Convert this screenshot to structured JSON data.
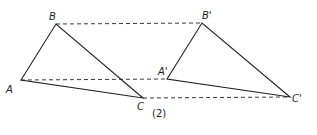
{
  "figure": {
    "caption": "(2)",
    "triangles": [
      {
        "name": "original",
        "vertices": [
          {
            "label": "A",
            "x": 21,
            "y": 80,
            "lx": 6,
            "ly": 93
          },
          {
            "label": "B",
            "x": 56,
            "y": 24,
            "lx": 49,
            "ly": 20
          },
          {
            "label": "C",
            "x": 143,
            "y": 98,
            "lx": 137,
            "ly": 110
          }
        ]
      },
      {
        "name": "translated",
        "vertices": [
          {
            "label": "A'",
            "x": 167,
            "y": 79,
            "lx": 158,
            "ly": 75
          },
          {
            "label": "B'",
            "x": 202,
            "y": 23,
            "lx": 202,
            "ly": 19
          },
          {
            "label": "C'",
            "x": 290,
            "y": 97,
            "lx": 292,
            "ly": 102
          }
        ]
      }
    ],
    "dashed_connectors": [
      {
        "from": "B",
        "to": "B'"
      },
      {
        "from": "A",
        "to": "A'"
      },
      {
        "from": "C",
        "to": "C'"
      }
    ],
    "colors": {
      "line": "#222222",
      "background": "#ffffff"
    }
  }
}
